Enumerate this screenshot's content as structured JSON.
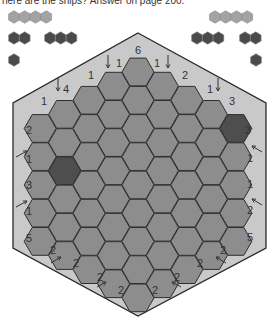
{
  "header": {
    "text": "here are the ships? Answer on page 200."
  },
  "colors": {
    "frame_fill": "#c9c9c9",
    "frame_stroke": "#2a2a2a",
    "cell_fill": "#8d8d8d",
    "cell_stroke": "#2e2e2e",
    "ship_fill": "#4e4e4e",
    "legend_light": "#a3a3a3",
    "legend_dark": "#4a4a4a"
  },
  "legend": {
    "left": [
      {
        "shape": "ship-4",
        "length": 4,
        "tone": "light"
      },
      {
        "shape": "ship-2",
        "length": 2,
        "tone": "dark"
      },
      {
        "shape": "ship-3",
        "length": 3,
        "tone": "dark"
      },
      {
        "shape": "ship-1",
        "length": 1,
        "tone": "dark"
      }
    ],
    "right": [
      {
        "shape": "ship-4",
        "length": 4,
        "tone": "light"
      },
      {
        "shape": "ship-3",
        "length": 3,
        "tone": "dark"
      },
      {
        "shape": "ship-2",
        "length": 2,
        "tone": "dark"
      },
      {
        "shape": "ship-1",
        "length": 1,
        "tone": "dark"
      }
    ]
  },
  "grid": {
    "column_counts": [
      5,
      6,
      7,
      8,
      9,
      8,
      7,
      6,
      5
    ],
    "shaded_cells": [
      {
        "col": 1,
        "row": 2
      },
      {
        "col": 8,
        "row": 0
      }
    ]
  },
  "clues": {
    "top": [
      {
        "value": "6",
        "arrow": false
      },
      {
        "value": "1",
        "arrow": true
      },
      {
        "value": "1",
        "arrow": true
      },
      {
        "value": "1",
        "arrow": false
      },
      {
        "value": "2",
        "arrow": false
      },
      {
        "value": "4",
        "arrow": true
      },
      {
        "value": "1",
        "arrow": true
      },
      {
        "value": "1",
        "arrow": false
      },
      {
        "value": "3",
        "arrow": false
      }
    ],
    "left": [
      {
        "value": "2",
        "arrow": false
      },
      {
        "value": "1",
        "arrow": true
      },
      {
        "value": "3",
        "arrow": false
      },
      {
        "value": "1",
        "arrow": true
      },
      {
        "value": "5",
        "arrow": false
      }
    ],
    "right": [
      {
        "value": "3",
        "arrow": false
      },
      {
        "value": "1",
        "arrow": true
      },
      {
        "value": "1",
        "arrow": false
      },
      {
        "value": "2",
        "arrow": true
      },
      {
        "value": "5",
        "arrow": false
      }
    ],
    "bottom": [
      {
        "value": "2",
        "arrow": false
      },
      {
        "value": "2",
        "arrow": true
      },
      {
        "value": "2",
        "arrow": false
      },
      {
        "value": "2",
        "arrow": true
      },
      {
        "value": "2",
        "arrow": false
      },
      {
        "value": "2",
        "arrow": false
      },
      {
        "value": "2",
        "arrow": true
      },
      {
        "value": "2",
        "arrow": true
      }
    ]
  }
}
